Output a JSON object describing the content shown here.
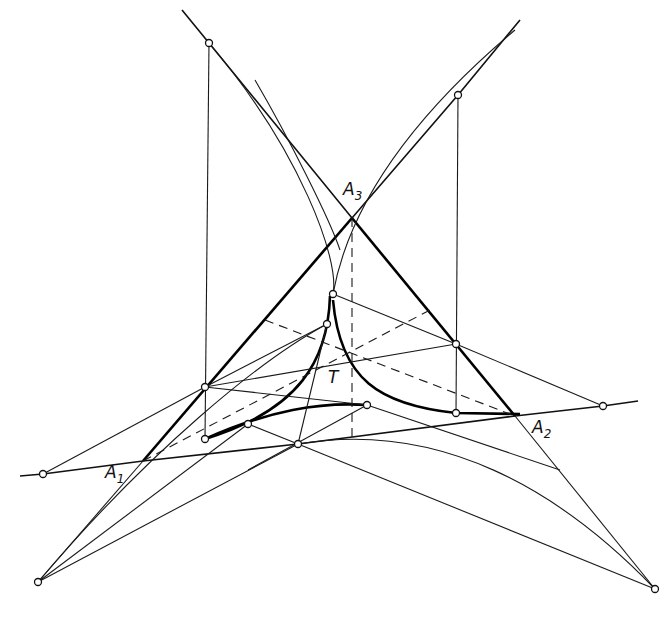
{
  "figure": {
    "type": "geometric-construction",
    "labels": {
      "a1": {
        "main": "A",
        "sub": "1"
      },
      "a2": {
        "main": "A",
        "sub": "2"
      },
      "a3": {
        "main": "A",
        "sub": "3"
      },
      "t": "T"
    },
    "colors": {
      "ink": "#111111",
      "background": "#ffffff"
    }
  }
}
